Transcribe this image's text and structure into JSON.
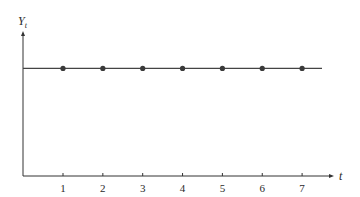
{
  "chart_data": {
    "type": "line",
    "title": "",
    "xlabel": "t",
    "ylabel": "Y",
    "ylabel_subscript": "t",
    "categories": [
      "1",
      "2",
      "3",
      "4",
      "5",
      "6",
      "7"
    ],
    "x": [
      1,
      2,
      3,
      4,
      5,
      6,
      7
    ],
    "series": [
      {
        "name": "Y_t",
        "values": [
          1,
          1,
          1,
          1,
          1,
          1,
          1
        ]
      }
    ],
    "ylim": [
      0,
      1.45
    ],
    "xlim": [
      0,
      7.9
    ],
    "grid": false,
    "legend": "none",
    "y_ticks_labeled": false,
    "markers": true
  },
  "colors": {
    "axis": "#333333",
    "line": "#444444",
    "marker": "#3a3a3a",
    "text": "#2a2a2a"
  }
}
